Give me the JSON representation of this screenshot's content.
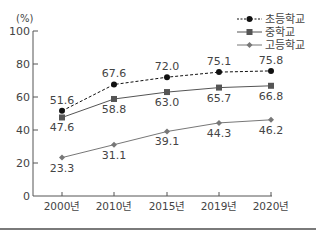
{
  "chart_data": {
    "type": "line",
    "title": "",
    "xlabel": "",
    "ylabel": "(%)",
    "ylim": [
      0,
      100
    ],
    "yticks": [
      0,
      20,
      40,
      60,
      80,
      100
    ],
    "categories": [
      "2000년",
      "2010년",
      "2015년",
      "2019년",
      "2020년"
    ],
    "grid": false,
    "legend_position": "top-right",
    "series": [
      {
        "name": "초등학교",
        "values": [
          51.6,
          67.6,
          72.0,
          75.1,
          75.8
        ],
        "labels": [
          "51.6",
          "67.6",
          "72.0",
          "75.1",
          "75.8"
        ],
        "style": "dashed",
        "marker": "circle",
        "color": "#111111",
        "label_pos": "above"
      },
      {
        "name": "중학교",
        "values": [
          47.6,
          58.8,
          63.0,
          65.7,
          66.8
        ],
        "labels": [
          "47.6",
          "58.8",
          "63.0",
          "65.7",
          "66.8"
        ],
        "style": "solid",
        "marker": "square",
        "color": "#555555",
        "label_pos": "below"
      },
      {
        "name": "고등학교",
        "values": [
          23.3,
          31.1,
          39.1,
          44.3,
          46.2
        ],
        "labels": [
          "23.3",
          "31.1",
          "39.1",
          "44.3",
          "46.2"
        ],
        "style": "solid",
        "marker": "diamond",
        "color": "#777777",
        "label_pos": "below"
      }
    ]
  }
}
